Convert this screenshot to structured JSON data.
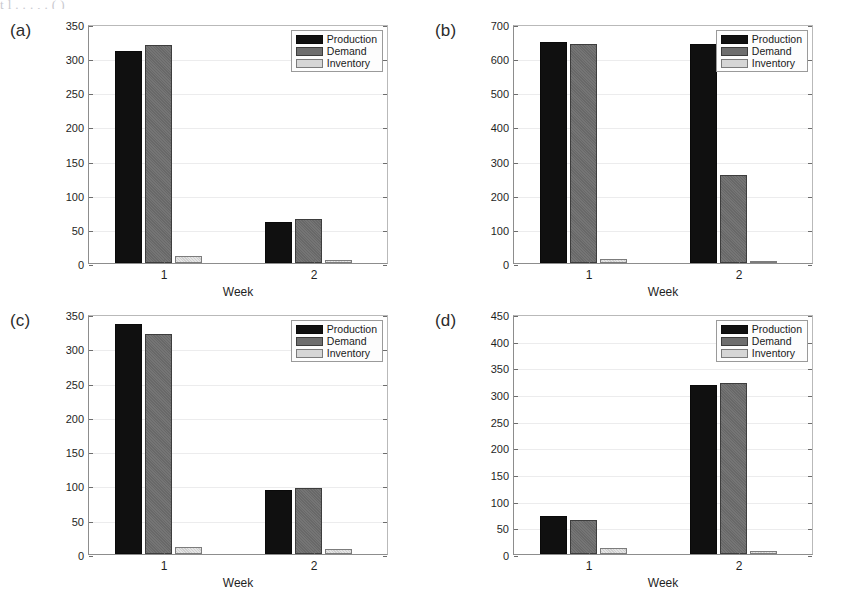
{
  "figure": {
    "top_partial_caption": "t      l            .   .  .   ,    .   (             )",
    "series_names": [
      "Production",
      "Demand",
      "Inventory"
    ],
    "series_colors": [
      "#101010",
      "#6e6e6e",
      "#d6d6d6"
    ],
    "xlabel": "Week",
    "categories": [
      "1",
      "2"
    ]
  },
  "panels": [
    {
      "label": "(a)",
      "name": "panel-a",
      "yticks": [
        "0",
        "50",
        "100",
        "150",
        "200",
        "250",
        "300",
        "350"
      ],
      "ylim": [
        0,
        350
      ],
      "legend": [
        "Production",
        "Demand",
        "Inventory"
      ]
    },
    {
      "label": "(b)",
      "name": "panel-b",
      "yticks": [
        "0",
        "100",
        "200",
        "300",
        "400",
        "500",
        "600",
        "700"
      ],
      "ylim": [
        0,
        700
      ],
      "legend": [
        "Production",
        "Demand",
        "Inventory"
      ]
    },
    {
      "label": "(c)",
      "name": "panel-c",
      "yticks": [
        "0",
        "50",
        "100",
        "150",
        "200",
        "250",
        "300",
        "350"
      ],
      "ylim": [
        0,
        350
      ],
      "legend": [
        "Production",
        "Demand",
        "Inventory"
      ]
    },
    {
      "label": "(d)",
      "name": "panel-d",
      "yticks": [
        "0",
        "50",
        "100",
        "150",
        "200",
        "250",
        "300",
        "350",
        "400",
        "450"
      ],
      "ylim": [
        0,
        450
      ],
      "legend": [
        "Production",
        "Demand",
        "Inventory"
      ]
    }
  ],
  "chart_data": [
    {
      "type": "bar",
      "title": "(a)",
      "categories": [
        "1",
        "2"
      ],
      "series": [
        {
          "name": "Production",
          "values": [
            311,
            60
          ]
        },
        {
          "name": "Demand",
          "values": [
            320,
            65
          ]
        },
        {
          "name": "Inventory",
          "values": [
            11,
            5
          ]
        }
      ],
      "xlabel": "Week",
      "ylabel": "",
      "ylim": [
        0,
        350
      ],
      "ytick_step": 50,
      "grid": true,
      "legend_position": "top-right"
    },
    {
      "type": "bar",
      "title": "(b)",
      "categories": [
        "1",
        "2"
      ],
      "series": [
        {
          "name": "Production",
          "values": [
            648,
            641
          ]
        },
        {
          "name": "Demand",
          "values": [
            641,
            257
          ]
        },
        {
          "name": "Inventory",
          "values": [
            11,
            7
          ]
        }
      ],
      "xlabel": "Week",
      "ylabel": "",
      "ylim": [
        0,
        700
      ],
      "ytick_step": 100,
      "grid": true,
      "legend_position": "top-right"
    },
    {
      "type": "bar",
      "title": "(c)",
      "categories": [
        "1",
        "2"
      ],
      "series": [
        {
          "name": "Production",
          "values": [
            336,
            93
          ]
        },
        {
          "name": "Demand",
          "values": [
            321,
            97
          ]
        },
        {
          "name": "Inventory",
          "values": [
            10,
            7
          ]
        }
      ],
      "xlabel": "Week",
      "ylabel": "",
      "ylim": [
        0,
        350
      ],
      "ytick_step": 50,
      "grid": true,
      "legend_position": "top-right"
    },
    {
      "type": "bar",
      "title": "(d)",
      "categories": [
        "1",
        "2"
      ],
      "series": [
        {
          "name": "Production",
          "values": [
            72,
            316
          ]
        },
        {
          "name": "Demand",
          "values": [
            63,
            321
          ]
        },
        {
          "name": "Inventory",
          "values": [
            11,
            5
          ]
        }
      ],
      "xlabel": "Week",
      "ylabel": "",
      "ylim": [
        0,
        450
      ],
      "ytick_step": 50,
      "grid": true,
      "legend_position": "top-right"
    }
  ]
}
